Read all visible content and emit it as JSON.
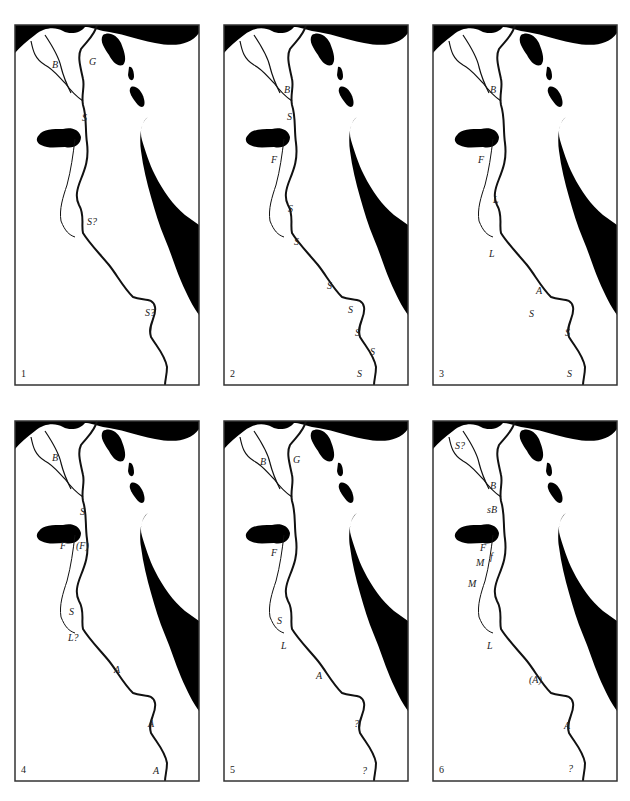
{
  "figure": {
    "colors": {
      "land": "#ffffff",
      "water": "#000000",
      "outline": "#1a1a1a"
    },
    "panels": [
      {
        "number": "1",
        "labels": [
          {
            "text": "B",
            "x": 37,
            "y": 35
          },
          {
            "text": "G",
            "x": 74,
            "y": 32
          },
          {
            "text": "S",
            "x": 67,
            "y": 88
          },
          {
            "text": "S?",
            "x": 72,
            "y": 192
          },
          {
            "text": "S?",
            "x": 130,
            "y": 283
          }
        ]
      },
      {
        "number": "2",
        "labels": [
          {
            "text": "B",
            "x": 60,
            "y": 60
          },
          {
            "text": "S",
            "x": 63,
            "y": 87
          },
          {
            "text": "F",
            "x": 47,
            "y": 130
          },
          {
            "text": "S",
            "x": 64,
            "y": 179
          },
          {
            "text": "S",
            "x": 70,
            "y": 212
          },
          {
            "text": "S",
            "x": 103,
            "y": 256
          },
          {
            "text": "S",
            "x": 124,
            "y": 280
          },
          {
            "text": "S",
            "x": 131,
            "y": 303
          },
          {
            "text": "S",
            "x": 146,
            "y": 322
          },
          {
            "text": "S",
            "x": 133,
            "y": 344
          }
        ]
      },
      {
        "number": "3",
        "labels": [
          {
            "text": "B",
            "x": 57,
            "y": 60
          },
          {
            "text": "F",
            "x": 45,
            "y": 130
          },
          {
            "text": "L",
            "x": 60,
            "y": 170
          },
          {
            "text": "L",
            "x": 56,
            "y": 224
          },
          {
            "text": "A",
            "x": 103,
            "y": 261
          },
          {
            "text": "S",
            "x": 96,
            "y": 284
          },
          {
            "text": "S",
            "x": 132,
            "y": 303
          },
          {
            "text": "S",
            "x": 134,
            "y": 344
          }
        ]
      },
      {
        "number": "4",
        "labels": [
          {
            "text": "B",
            "x": 37,
            "y": 32
          },
          {
            "text": "S",
            "x": 65,
            "y": 86
          },
          {
            "text": "F",
            "x": 45,
            "y": 120
          },
          {
            "text": "(F)",
            "x": 61,
            "y": 120
          },
          {
            "text": "S",
            "x": 54,
            "y": 186
          },
          {
            "text": "L?",
            "x": 53,
            "y": 212
          },
          {
            "text": "A",
            "x": 99,
            "y": 244
          },
          {
            "text": "A",
            "x": 133,
            "y": 298
          },
          {
            "text": "A",
            "x": 138,
            "y": 345
          }
        ]
      },
      {
        "number": "5",
        "labels": [
          {
            "text": "B",
            "x": 36,
            "y": 36
          },
          {
            "text": "G",
            "x": 69,
            "y": 34
          },
          {
            "text": "F",
            "x": 47,
            "y": 127
          },
          {
            "text": "S",
            "x": 53,
            "y": 195
          },
          {
            "text": "L",
            "x": 57,
            "y": 220
          },
          {
            "text": "A",
            "x": 92,
            "y": 250
          },
          {
            "text": "?",
            "x": 130,
            "y": 298
          },
          {
            "text": "?",
            "x": 138,
            "y": 345
          }
        ]
      },
      {
        "number": "6",
        "labels": [
          {
            "text": "S?",
            "x": 22,
            "y": 20
          },
          {
            "text": "B",
            "x": 57,
            "y": 60
          },
          {
            "text": "sB",
            "x": 54,
            "y": 84
          },
          {
            "text": "F",
            "x": 47,
            "y": 122
          },
          {
            "text": "M",
            "x": 43,
            "y": 137
          },
          {
            "text": "f",
            "x": 57,
            "y": 131
          },
          {
            "text": "M",
            "x": 35,
            "y": 158
          },
          {
            "text": "L",
            "x": 54,
            "y": 220
          },
          {
            "text": "(A)",
            "x": 96,
            "y": 254
          },
          {
            "text": "A",
            "x": 131,
            "y": 300
          },
          {
            "text": "?",
            "x": 135,
            "y": 343
          }
        ]
      }
    ],
    "panel_positions": [
      {
        "x": 15,
        "y": 25
      },
      {
        "x": 224,
        "y": 25
      },
      {
        "x": 433,
        "y": 25
      },
      {
        "x": 15,
        "y": 421
      },
      {
        "x": 224,
        "y": 421
      },
      {
        "x": 433,
        "y": 421
      }
    ]
  }
}
